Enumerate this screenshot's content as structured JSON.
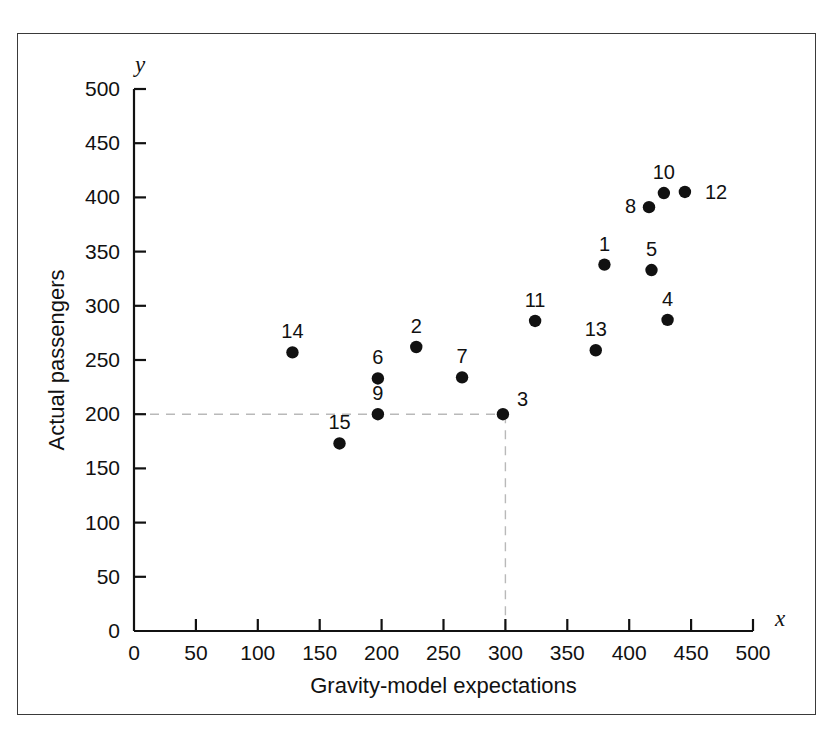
{
  "figure": {
    "frame_color": "#3a3a3a",
    "background": "#ffffff"
  },
  "axes": {
    "x_var_label": "x",
    "y_var_label": "y",
    "x_title": "Gravity-model expectations",
    "y_title": "Actual passengers",
    "x_ticks": [
      "0",
      "50",
      "100",
      "150",
      "200",
      "250",
      "300",
      "350",
      "400",
      "450",
      "500"
    ],
    "y_ticks": [
      "0",
      "50",
      "100",
      "150",
      "200",
      "250",
      "300",
      "350",
      "400",
      "450",
      "500"
    ],
    "x_origin_label": "0",
    "y_origin_label": "0"
  },
  "guides": {
    "horizontal_value": 200,
    "vertical_value": 300,
    "color": "#b9b9b9"
  },
  "chart_data": {
    "type": "scatter",
    "title": "",
    "xlabel": "Gravity-model expectations",
    "ylabel": "Actual passengers",
    "xlim": [
      0,
      500
    ],
    "ylim": [
      0,
      500
    ],
    "xticks": [
      0,
      50,
      100,
      150,
      200,
      250,
      300,
      350,
      400,
      450,
      500
    ],
    "yticks": [
      0,
      50,
      100,
      150,
      200,
      250,
      300,
      350,
      400,
      450,
      500
    ],
    "grid": false,
    "legend": null,
    "marker_color": "#111111",
    "points": [
      {
        "label": "1",
        "x": 380,
        "y": 338,
        "label_dx": 0,
        "label_dy": -14,
        "anchor": "middle"
      },
      {
        "label": "2",
        "x": 228,
        "y": 262,
        "label_dx": 0,
        "label_dy": -14,
        "anchor": "middle"
      },
      {
        "label": "3",
        "x": 298,
        "y": 200,
        "label_dx": 14,
        "label_dy": -8,
        "anchor": "start"
      },
      {
        "label": "4",
        "x": 431,
        "y": 287,
        "label_dx": 0,
        "label_dy": -14,
        "anchor": "middle"
      },
      {
        "label": "5",
        "x": 418,
        "y": 333,
        "label_dx": 0,
        "label_dy": -14,
        "anchor": "middle"
      },
      {
        "label": "6",
        "x": 197,
        "y": 233,
        "label_dx": 0,
        "label_dy": -14,
        "anchor": "middle"
      },
      {
        "label": "7",
        "x": 265,
        "y": 234,
        "label_dx": 0,
        "label_dy": -14,
        "anchor": "middle"
      },
      {
        "label": "8",
        "x": 416,
        "y": 391,
        "label_dx": -13,
        "label_dy": 6,
        "anchor": "end"
      },
      {
        "label": "9",
        "x": 197,
        "y": 200,
        "label_dx": 0,
        "label_dy": -14,
        "anchor": "middle"
      },
      {
        "label": "10",
        "x": 428,
        "y": 404,
        "label_dx": 0,
        "label_dy": -14,
        "anchor": "middle"
      },
      {
        "label": "11",
        "x": 324,
        "y": 286,
        "label_dx": 0,
        "label_dy": -14,
        "anchor": "middle"
      },
      {
        "label": "12",
        "x": 445,
        "y": 405,
        "label_dx": 20,
        "label_dy": 7,
        "anchor": "start"
      },
      {
        "label": "13",
        "x": 373,
        "y": 259,
        "label_dx": 0,
        "label_dy": -14,
        "anchor": "middle"
      },
      {
        "label": "14",
        "x": 128,
        "y": 257,
        "label_dx": 0,
        "label_dy": -14,
        "anchor": "middle"
      },
      {
        "label": "15",
        "x": 166,
        "y": 173,
        "label_dx": 0,
        "label_dy": -14,
        "anchor": "middle"
      }
    ]
  }
}
